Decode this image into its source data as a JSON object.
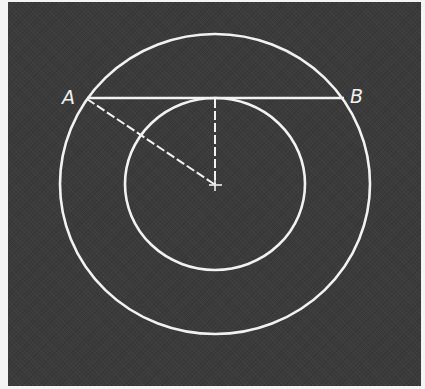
{
  "diagram": {
    "type": "concentric-circles-chord",
    "colors": {
      "background": "#3b3b3b",
      "frame": "#f4f4f4",
      "stroke": "#f2f2f2"
    },
    "center": {
      "x": 215,
      "y": 184
    },
    "outer_circle": {
      "rx": 155,
      "ry": 150
    },
    "inner_circle": {
      "rx": 90,
      "ry": 86
    },
    "chord": {
      "y": 98,
      "x1": 87,
      "x2": 344
    },
    "points": [
      {
        "id": "A",
        "label": "A",
        "x": 70,
        "y": 98
      },
      {
        "id": "B",
        "label": "B",
        "x": 358,
        "y": 97
      }
    ],
    "segments": [
      {
        "from": "A",
        "to": "center",
        "style": "dashed"
      },
      {
        "from": "tangent-point",
        "to": "center",
        "style": "dashed"
      }
    ]
  }
}
